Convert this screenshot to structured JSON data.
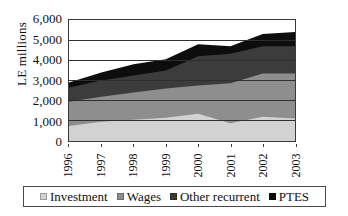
{
  "chart_data": {
    "type": "area",
    "title": "",
    "subtitle": "",
    "xlabel": "",
    "ylabel": "LE millions",
    "categories": [
      "1996",
      "1997",
      "1998",
      "1999",
      "2000",
      "2001",
      "2002",
      "2003"
    ],
    "x": [
      1996,
      1997,
      1998,
      1999,
      2000,
      2001,
      2002,
      2003
    ],
    "ylim": [
      0,
      6000
    ],
    "ytick_labels": [
      "6,000",
      "5,000",
      "4,000",
      "3,000",
      "2,000",
      "1,000",
      "0"
    ],
    "ytick_values": [
      6000,
      5000,
      4000,
      3000,
      2000,
      1000,
      0
    ],
    "grid": true,
    "grid_axis": "y",
    "stacked": true,
    "legend_position": "bottom",
    "series": [
      {
        "name": "Investment",
        "color": "#d2d2d2",
        "values": [
          750,
          950,
          1050,
          1150,
          1350,
          880,
          1200,
          1120
        ]
      },
      {
        "name": "Wages",
        "color": "#8e8e8e",
        "values": [
          1200,
          1250,
          1350,
          1450,
          1400,
          1980,
          2150,
          2230
        ]
      },
      {
        "name": "Other recurrent",
        "color": "#3c3c3c",
        "values": [
          700,
          800,
          850,
          900,
          1450,
          1470,
          1350,
          1350
        ]
      },
      {
        "name": "PTES",
        "color": "#0d0d0d",
        "values": [
          250,
          400,
          550,
          550,
          600,
          370,
          600,
          700
        ]
      }
    ],
    "cumulative_totals": [
      2900,
      3400,
      3800,
      4050,
      4800,
      4700,
      5300,
      5400
    ]
  },
  "legend": {
    "items": [
      {
        "label": "Investment",
        "swatch": "#d2d2d2"
      },
      {
        "label": "Wages",
        "swatch": "#8e8e8e"
      },
      {
        "label": "Other recurrent",
        "swatch": "#3c3c3c"
      },
      {
        "label": "PTES",
        "swatch": "#0d0d0d"
      }
    ]
  }
}
